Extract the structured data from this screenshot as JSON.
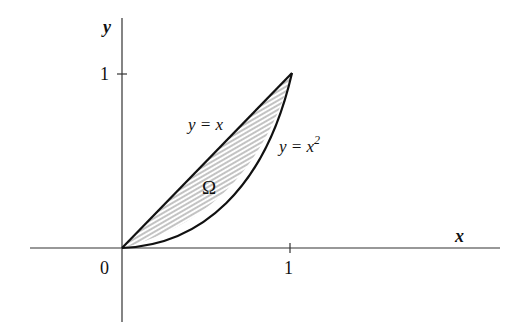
{
  "figure": {
    "axes": {
      "x_label": "x",
      "y_label": "y",
      "origin_label": "0",
      "x_tick_label": "1",
      "y_tick_label": "1"
    },
    "curves": [
      {
        "name": "line",
        "label": "y = x",
        "function": "y = x"
      },
      {
        "name": "parabola",
        "label_base": "y = x",
        "label_exp": "2",
        "function": "y = x^2"
      }
    ],
    "region": {
      "label": "Ω",
      "description": "Shaded region between y = x and y = x^2 for 0 ≤ x ≤ 1",
      "fill": "hatched"
    },
    "colors": {
      "stroke": "#111111",
      "hatch": "#9a9a9a",
      "background": "#ffffff"
    }
  }
}
